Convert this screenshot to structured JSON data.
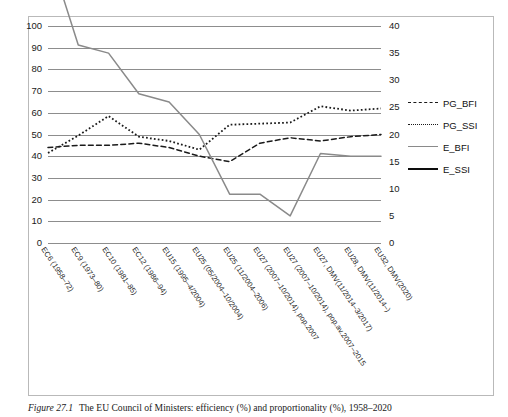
{
  "figure": {
    "caption_number": "Figure 27.1",
    "caption_text": "The EU Council of Ministers: efficiency (%) and proportionality (%), 1958–2020"
  },
  "legend": {
    "position": "right",
    "entries": [
      {
        "label": "PG_BFI",
        "style": "dashed",
        "color": "#1a1a1a"
      },
      {
        "label": "PG_SSI",
        "style": "dotted",
        "color": "#1a1a1a"
      },
      {
        "label": "E_BFI",
        "style": "solid",
        "color": "#8a8a8a"
      },
      {
        "label": "E_SSI",
        "style": "solid",
        "color": "#0d0d0d"
      }
    ]
  },
  "axes": {
    "left": {
      "ticks": [
        "100",
        "90",
        "80",
        "70",
        "60",
        "50",
        "40",
        "30",
        "20",
        "10",
        "0"
      ],
      "min": 0,
      "max": 100,
      "step": 10
    },
    "right": {
      "ticks": [
        "40",
        "35",
        "30",
        "25",
        "20",
        "15",
        "10",
        "5",
        "0"
      ],
      "min": 0,
      "max": 40,
      "step": 5
    }
  },
  "chart_data": {
    "type": "line",
    "title": "The EU Council of Ministers: efficiency (%) and proportionality (%), 1958–2020",
    "xlabel": "",
    "ylabel": "",
    "ylim": [
      0,
      100
    ],
    "y2lim": [
      0,
      40
    ],
    "grid": true,
    "legend_position": "right",
    "categories": [
      "EC6 (1958–72)",
      "EC9 (1973–80)",
      "EC10 (1981–85)",
      "EC12 (1986–94)",
      "EU15 (1995–4/2004)",
      "EU25 (05/2004–10/2004)",
      "EU25 (11/2004–2006)",
      "EU27 (2007–10/2014), pop.2007",
      "EU27 (2007–10/2014), pop.av.2007–2015",
      "EU27, DMV(11/2014–3/2017)",
      "EU28, DMV(11/2014–)",
      "EU32, DMV(2020)"
    ],
    "series": [
      {
        "name": "PG_BFI",
        "axis": "left",
        "style": "dashed",
        "color": "#1a1a1a",
        "values": [
          44,
          45,
          45,
          46,
          44,
          40,
          37.5,
          46,
          48.5,
          47,
          49,
          50
        ]
      },
      {
        "name": "PG_SSI",
        "axis": "left",
        "style": "dotted",
        "color": "#1a1a1a",
        "values": [
          41.5,
          49.5,
          58.5,
          49,
          47,
          43,
          54.5,
          55,
          55.5,
          63,
          61,
          62
        ]
      },
      {
        "name": "E_BFI",
        "axis": "right",
        "style": "solid",
        "color": "#8a8a8a",
        "values": [
          54,
          36.5,
          35,
          27.5,
          26,
          20,
          9,
          9,
          5,
          16.5,
          16,
          16
        ]
      },
      {
        "name": "E_SSI",
        "axis": "right",
        "style": "solid",
        "color": "#0d0d0d",
        "values": [
          87.5,
          80.5,
          80,
          77.5,
          77.5,
          75,
          69.5,
          96,
          93.5,
          95,
          96,
          93.5
        ]
      }
    ]
  }
}
